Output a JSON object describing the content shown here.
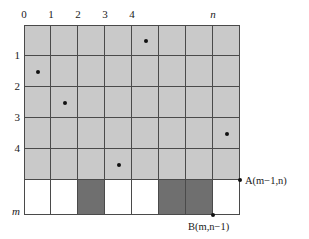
{
  "figure": {
    "name": "lattice-path-grid",
    "columns": 8,
    "rows": 6,
    "colors": {
      "light_cell": "#c9c9c9",
      "dark_cell": "#6f6f6f",
      "white_cell": "#ffffff",
      "grid_line": "#4a4a4a",
      "dot": "#111111",
      "background": "#ffffff"
    }
  },
  "axes": {
    "top_labels": [
      {
        "text": "0",
        "col": 0,
        "italic": false
      },
      {
        "text": "1",
        "col": 1,
        "italic": false
      },
      {
        "text": "2",
        "col": 2,
        "italic": false
      },
      {
        "text": "3",
        "col": 3,
        "italic": false
      },
      {
        "text": "4",
        "col": 4,
        "italic": false
      },
      {
        "text": "n",
        "col": 7,
        "italic": true
      }
    ],
    "left_labels": [
      {
        "text": "1",
        "row": 1,
        "italic": false
      },
      {
        "text": "2",
        "row": 2,
        "italic": false
      },
      {
        "text": "3",
        "row": 3,
        "italic": false
      },
      {
        "text": "4",
        "row": 4,
        "italic": false
      },
      {
        "text": "m",
        "row": 6,
        "italic": true
      }
    ]
  },
  "cells": {
    "dark_bottom_columns": [
      2,
      5,
      6
    ],
    "light_rows": [
      0,
      1,
      2,
      3,
      4
    ],
    "white_row": 5
  },
  "dots": [
    {
      "row": 0,
      "col": 4
    },
    {
      "row": 1,
      "col": 0
    },
    {
      "row": 2,
      "col": 1
    },
    {
      "row": 3,
      "col": 7
    },
    {
      "row": 4,
      "col": 3
    }
  ],
  "annotations": [
    {
      "id": "point-a",
      "prefix": "A(",
      "var1": "m",
      "mid": "−1,",
      "var2": "n",
      "suffix": ")",
      "full_text": "A(m−1,n)",
      "corner_col": 8,
      "corner_row": 5
    },
    {
      "id": "point-b",
      "prefix": "B(",
      "var1": "m",
      "mid": ",",
      "var2": "n",
      "suffix": "−1)",
      "full_text": "B(m,n−1)",
      "corner_col": 7,
      "corner_row": 6
    }
  ]
}
